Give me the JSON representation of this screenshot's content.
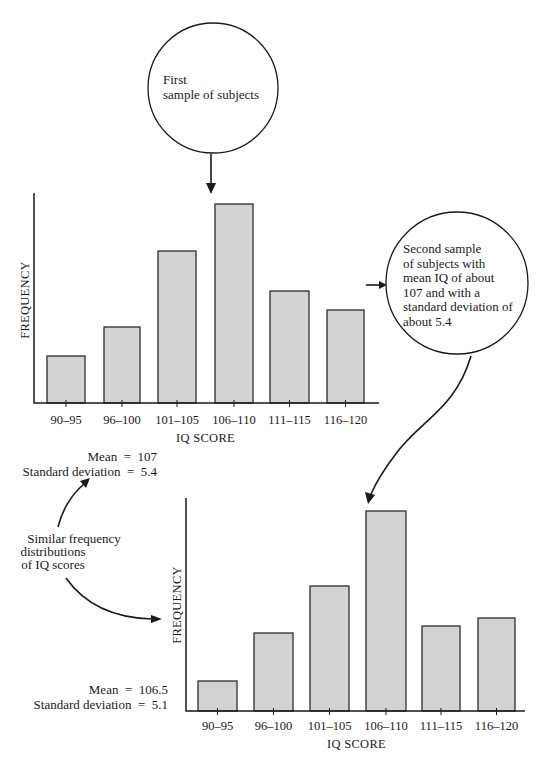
{
  "chart_data": [
    {
      "type": "bar",
      "title": "First sample of subjects",
      "categories": [
        "90–95",
        "96–100",
        "101–105",
        "106–110",
        "111–115",
        "116–120"
      ],
      "values": [
        47,
        76,
        152,
        199,
        112,
        93
      ],
      "value_units": "relative frequency (pixel height, no numeric y-axis shown)",
      "xlabel": "IQ SCORE",
      "ylabel": "FREQUENCY",
      "stats": {
        "mean_label": "Mean",
        "mean": "107",
        "sd_label": "Standard deviation",
        "sd": "5.4"
      },
      "grid": false,
      "layout": {
        "axis_x": 34,
        "axis_top": 193,
        "baseline": 403,
        "axis_right": 379,
        "bars": [
          {
            "x": 47,
            "w": 38
          },
          {
            "x": 104,
            "w": 36
          },
          {
            "x": 158,
            "w": 38
          },
          {
            "x": 215,
            "w": 38
          },
          {
            "x": 270,
            "w": 39
          },
          {
            "x": 327,
            "w": 37
          }
        ],
        "tick_label_y": 424,
        "xlabel_y": 442,
        "ylabel_x": 29,
        "ylabel_y": 300
      }
    },
    {
      "type": "bar",
      "title": "Second sample of subjects",
      "categories": [
        "90–95",
        "96–100",
        "101–105",
        "106–110",
        "111–115",
        "116–120"
      ],
      "values": [
        30,
        78,
        125,
        200,
        85,
        93
      ],
      "value_units": "relative frequency (pixel height, no numeric y-axis shown)",
      "xlabel": "IQ SCORE",
      "ylabel": "FREQUENCY",
      "stats": {
        "mean_label": "Mean",
        "mean": "106.5",
        "sd_label": "Standard deviation",
        "sd": "5.1"
      },
      "grid": false,
      "layout": {
        "axis_x": 186,
        "axis_top": 498,
        "baseline": 711,
        "axis_right": 525,
        "bars": [
          {
            "x": 198,
            "w": 39
          },
          {
            "x": 254,
            "w": 39
          },
          {
            "x": 310,
            "w": 39
          },
          {
            "x": 366,
            "w": 40
          },
          {
            "x": 422,
            "w": 38
          },
          {
            "x": 478,
            "w": 37
          }
        ],
        "tick_label_y": 730,
        "xlabel_y": 748,
        "ylabel_x": 181,
        "ylabel_y": 605
      }
    }
  ],
  "annotations": {
    "first_sample": {
      "lines": [
        "First",
        "sample of subjects"
      ]
    },
    "second_sample": {
      "lines": [
        "Second sample",
        "of subjects with",
        "mean IQ of about",
        "107 and with a",
        "standard deviation of",
        "about 5.4"
      ]
    },
    "similar": {
      "lines": [
        "Similar frequency",
        "distributions",
        "of IQ scores"
      ]
    },
    "stats_top": {
      "mean_line": "Mean  =  107",
      "sd_line": "Standard deviation  =  5.4"
    },
    "stats_bottom": {
      "mean_line": "Mean  =  106.5",
      "sd_line": "Standard deviation  =  5.1"
    }
  },
  "icons": {
    "arrow_down": "arrow-down-icon",
    "arrow_right": "arrow-right-icon",
    "curved_arrow": "curved-arrow-icon"
  }
}
